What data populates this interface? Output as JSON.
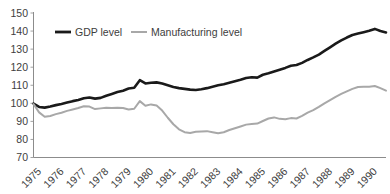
{
  "chart_data": {
    "type": "line",
    "title": "",
    "subtitle": "",
    "xlabel": "",
    "ylabel": "",
    "ylim": [
      70,
      150
    ],
    "xlim": [
      1975,
      1990.75
    ],
    "ytick_labels": [
      "150",
      "140",
      "130",
      "120",
      "110",
      "100",
      "90",
      "80",
      "70"
    ],
    "ytick_values": [
      150,
      140,
      130,
      120,
      110,
      100,
      90,
      80,
      70
    ],
    "xtick_labels": [
      "1975",
      "1976",
      "1977",
      "1978",
      "1979",
      "1980",
      "1981",
      "1982",
      "1983",
      "1984",
      "1985",
      "1986",
      "1987",
      "1988",
      "1989",
      "1990"
    ],
    "xtick_values": [
      1975,
      1976,
      1977,
      1978,
      1979,
      1980,
      1981,
      1982,
      1983,
      1984,
      1985,
      1986,
      1987,
      1988,
      1989,
      1990
    ],
    "grid": false,
    "legend_position": "top-left-inside",
    "series": [
      {
        "name": "GDP level",
        "color": "#1a1a1a",
        "width": 2.6,
        "x": [
          1975.0,
          1975.25,
          1975.5,
          1975.75,
          1976.0,
          1976.25,
          1976.5,
          1976.75,
          1977.0,
          1977.25,
          1977.5,
          1977.75,
          1978.0,
          1978.25,
          1978.5,
          1978.75,
          1979.0,
          1979.25,
          1979.5,
          1979.75,
          1980.0,
          1980.25,
          1980.5,
          1980.75,
          1981.0,
          1981.25,
          1981.5,
          1981.75,
          1982.0,
          1982.25,
          1982.5,
          1982.75,
          1983.0,
          1983.25,
          1983.5,
          1983.75,
          1984.0,
          1984.25,
          1984.5,
          1984.75,
          1985.0,
          1985.25,
          1985.5,
          1985.75,
          1986.0,
          1986.25,
          1986.5,
          1986.75,
          1987.0,
          1987.25,
          1987.5,
          1987.75,
          1988.0,
          1988.25,
          1988.5,
          1988.75,
          1989.0,
          1989.25,
          1989.5,
          1989.75,
          1990.0,
          1990.25,
          1990.5,
          1990.75
        ],
        "values": [
          99.8,
          98.0,
          97.6,
          98.2,
          99.0,
          99.6,
          100.4,
          101.2,
          101.8,
          102.8,
          103.2,
          102.6,
          103.0,
          104.2,
          105.2,
          106.2,
          107.0,
          108.2,
          108.6,
          112.8,
          111.0,
          111.4,
          111.6,
          111.0,
          110.0,
          109.0,
          108.4,
          108.0,
          107.6,
          107.4,
          107.8,
          108.4,
          109.2,
          110.0,
          110.6,
          111.4,
          112.2,
          113.0,
          114.0,
          114.4,
          114.2,
          115.8,
          116.6,
          117.6,
          118.6,
          119.6,
          120.8,
          121.2,
          122.4,
          124.0,
          125.4,
          127.0,
          129.0,
          131.0,
          133.0,
          134.8,
          136.4,
          137.8,
          138.6,
          139.4,
          140.2,
          141.2,
          140.0,
          139.2
        ]
      },
      {
        "name": "Manufacturing level",
        "color": "#a8a8a8",
        "width": 2.0,
        "x": [
          1975.0,
          1975.25,
          1975.5,
          1975.75,
          1976.0,
          1976.25,
          1976.5,
          1976.75,
          1977.0,
          1977.25,
          1977.5,
          1977.75,
          1978.0,
          1978.25,
          1978.5,
          1978.75,
          1979.0,
          1979.25,
          1979.5,
          1979.75,
          1980.0,
          1980.25,
          1980.5,
          1980.75,
          1981.0,
          1981.25,
          1981.5,
          1981.75,
          1982.0,
          1982.25,
          1982.5,
          1982.75,
          1983.0,
          1983.25,
          1983.5,
          1983.75,
          1984.0,
          1984.25,
          1984.5,
          1984.75,
          1985.0,
          1985.25,
          1985.5,
          1985.75,
          1986.0,
          1986.25,
          1986.5,
          1986.75,
          1987.0,
          1987.25,
          1987.5,
          1987.75,
          1988.0,
          1988.25,
          1988.5,
          1988.75,
          1989.0,
          1989.25,
          1989.5,
          1989.75,
          1990.0,
          1990.25,
          1990.5,
          1990.75
        ],
        "values": [
          99.6,
          95.0,
          92.6,
          93.0,
          94.0,
          94.8,
          95.8,
          96.6,
          97.4,
          98.4,
          98.2,
          96.8,
          97.2,
          97.6,
          97.4,
          97.6,
          97.4,
          96.6,
          97.0,
          101.2,
          98.6,
          99.4,
          98.8,
          96.0,
          92.0,
          88.4,
          85.6,
          84.0,
          83.6,
          84.2,
          84.4,
          84.6,
          84.0,
          83.4,
          84.0,
          85.2,
          86.2,
          87.2,
          88.2,
          88.6,
          88.8,
          90.2,
          91.6,
          92.2,
          91.4,
          91.2,
          91.8,
          91.6,
          93.0,
          94.8,
          96.2,
          98.0,
          100.0,
          101.8,
          103.6,
          105.2,
          106.6,
          108.0,
          109.0,
          109.2,
          109.2,
          109.6,
          108.4,
          107.0
        ]
      }
    ]
  },
  "legend": {
    "items": [
      {
        "label": "GDP level",
        "color": "#1a1a1a"
      },
      {
        "label": "Manufacturing level",
        "color": "#a8a8a8"
      }
    ]
  },
  "axis": {
    "axis_color": "#8c8c8c"
  }
}
